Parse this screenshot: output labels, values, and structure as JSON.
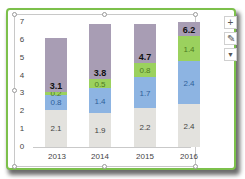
{
  "chart_data": {
    "type": "bar",
    "stacked": true,
    "categories": [
      "2013",
      "2014",
      "2015",
      "2016"
    ],
    "series": [
      {
        "name": "Series 1",
        "color": "#e3e2de",
        "values": [
          2.1,
          1.9,
          2.2,
          2.4
        ]
      },
      {
        "name": "Series 2",
        "color": "#8db4e2",
        "values": [
          0.8,
          1.4,
          1.7,
          2.4
        ]
      },
      {
        "name": "Series 3",
        "color": "#9bd15e",
        "values": [
          0.2,
          0.5,
          0.8,
          1.4
        ]
      },
      {
        "name": "Filler",
        "color": "#a89db4",
        "values": [
          3.0,
          3.1,
          2.2,
          0.8
        ]
      }
    ],
    "totals": [
      3.1,
      3.8,
      4.7,
      6.2
    ],
    "title": "",
    "xlabel": "",
    "ylabel": "",
    "ylim": [
      0,
      7
    ],
    "yticks": [
      "0",
      "1",
      "2",
      "3",
      "4",
      "5",
      "6",
      "7"
    ],
    "grid": false,
    "legend": "none"
  },
  "labels": {
    "s1": [
      "2.1",
      "1.9",
      "2.2",
      "2.4"
    ],
    "s2": [
      "0.8",
      "1.4",
      "1.7",
      "2.4"
    ],
    "s3": [
      "0.2",
      "0.5",
      "0.8",
      "1.4"
    ],
    "total": [
      "3.1",
      "3.8",
      "4.7",
      "6.2"
    ]
  },
  "side_buttons": {
    "add": "+",
    "style": "✎",
    "filter": "▼"
  }
}
